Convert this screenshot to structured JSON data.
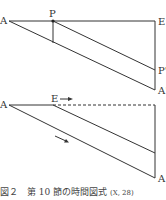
{
  "diagram_top": {
    "labels": {
      "A": "A",
      "P": "P",
      "E": "E",
      "P_prime": "P'",
      "A_prime": "A'"
    }
  },
  "diagram_bottom": {
    "labels": {
      "A_left": "A",
      "E": "E",
      "A_right": "A"
    }
  },
  "caption": {
    "figure": "図２",
    "title": "第 10 節の時間図式",
    "ref": "(X, 28)"
  },
  "colors": {
    "line": "#333333",
    "text": "#333333"
  }
}
